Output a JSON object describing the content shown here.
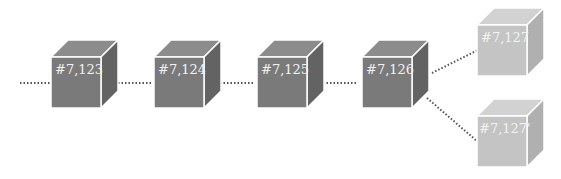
{
  "diagram": {
    "type": "blockchain-fork",
    "colors": {
      "confirmed_front": "#7a7a7a",
      "confirmed_top": "#8c8c8c",
      "confirmed_side": "#636363",
      "fork_front": "#c4c4c4",
      "fork_top": "#d2d2d2",
      "fork_side": "#b0b0b0",
      "connector": "#555555",
      "label": "#f2f2f2"
    },
    "blocks": [
      {
        "id": "b1",
        "label": "#7,123",
        "status": "confirmed"
      },
      {
        "id": "b2",
        "label": "#7,124",
        "status": "confirmed"
      },
      {
        "id": "b3",
        "label": "#7,125",
        "status": "confirmed"
      },
      {
        "id": "b4",
        "label": "#7,126",
        "status": "confirmed"
      },
      {
        "id": "b5",
        "label": "#7,127",
        "status": "fork"
      },
      {
        "id": "b6",
        "label": "#7,127'",
        "status": "fork"
      }
    ],
    "connections": [
      {
        "from": "start",
        "to": "b1"
      },
      {
        "from": "b1",
        "to": "b2"
      },
      {
        "from": "b2",
        "to": "b3"
      },
      {
        "from": "b3",
        "to": "b4"
      },
      {
        "from": "b4",
        "to": "b5"
      },
      {
        "from": "b4",
        "to": "b6"
      }
    ]
  }
}
